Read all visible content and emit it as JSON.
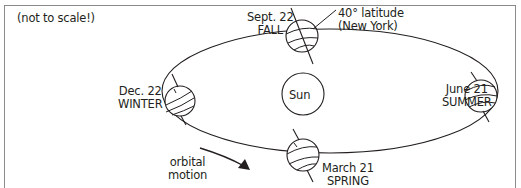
{
  "diagram": {
    "type": "earth-orbit-seasons",
    "note": "(not to scale!)",
    "center_body": {
      "label": "Sun"
    },
    "positions": [
      {
        "id": "fall",
        "date": "Sept. 22",
        "season": "FALL"
      },
      {
        "id": "summer",
        "date": "June 21",
        "season": "SUMMER"
      },
      {
        "id": "spring",
        "date": "March 21",
        "season": "SPRING"
      },
      {
        "id": "winter",
        "date": "Dec. 22",
        "season": "WINTER"
      }
    ],
    "annotations": {
      "latitude_line1": "40° latitude",
      "latitude_line2": "(New York)",
      "orbit_line1": "orbital",
      "orbit_line2": "motion"
    },
    "colors": {
      "stroke": "#231f20",
      "frame": "#8a8a8a",
      "background": "#ffffff"
    }
  }
}
